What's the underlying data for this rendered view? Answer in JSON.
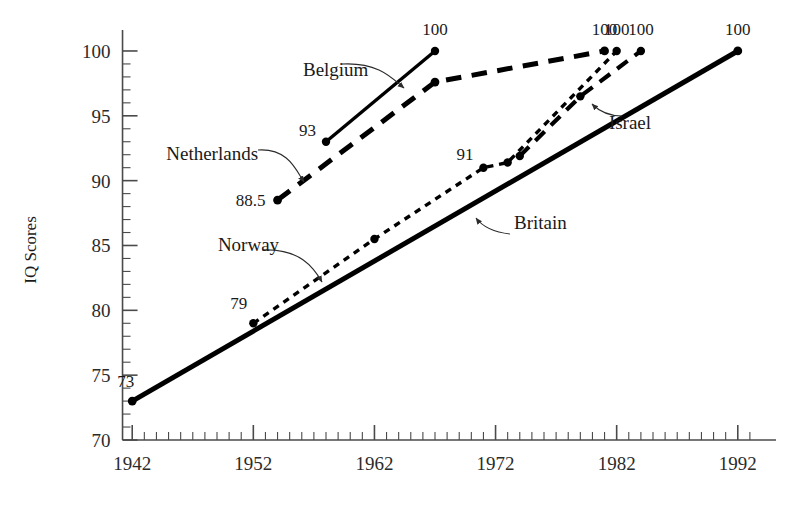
{
  "chart_data": {
    "type": "line",
    "title": "",
    "subtitle": "",
    "xlabel": "",
    "ylabel": "IQ Scores",
    "xlim": [
      1940,
      1994
    ],
    "ylim": [
      70,
      101
    ],
    "grid": false,
    "legend_position": "inline-annotations",
    "x_major_ticks": [
      1942,
      1952,
      1962,
      1972,
      1982,
      1992
    ],
    "x_tick_labels": [
      "1942",
      "1952",
      "1962",
      "1972",
      "1982",
      "1992"
    ],
    "x_minor_tick_step": 1,
    "y_major_ticks": [
      70,
      75,
      80,
      85,
      90,
      95,
      100
    ],
    "y_tick_labels": [
      "70",
      "75",
      "80",
      "85",
      "90",
      "95",
      "100"
    ],
    "y_minor_tick_step": 1,
    "series": [
      {
        "name": "Britain",
        "line_style": "solid",
        "line_width": 5.0,
        "x": [
          1942,
          1992
        ],
        "y": [
          73,
          100
        ],
        "point_labels": [
          "73",
          "100"
        ]
      },
      {
        "name": "Norway",
        "line_style": "short-dash",
        "line_width": 3.4,
        "x": [
          1952,
          1962,
          1971,
          1973,
          1982
        ],
        "y": [
          79,
          85.5,
          91,
          91.4,
          100
        ],
        "point_labels": [
          "79",
          "",
          "91",
          "",
          "100"
        ]
      },
      {
        "name": "Netherlands",
        "line_style": "long-dash",
        "line_width": 5.0,
        "x": [
          1954,
          1967,
          1981
        ],
        "y": [
          88.5,
          97.6,
          100
        ],
        "point_labels": [
          "88.5",
          "",
          "100"
        ]
      },
      {
        "name": "Belgium",
        "line_style": "solid",
        "line_width": 3.4,
        "x": [
          1958,
          1967
        ],
        "y": [
          93,
          100
        ],
        "point_labels": [
          "93",
          "100"
        ]
      },
      {
        "name": "Israel",
        "line_style": "long-dash",
        "line_width": 4.2,
        "x": [
          1974,
          1979,
          1984
        ],
        "y": [
          91.9,
          96.5,
          100
        ],
        "point_labels": [
          "",
          "",
          "100"
        ]
      }
    ],
    "annotations": [
      {
        "text": "Belgium",
        "x": 1958.8,
        "y": 98.1
      },
      {
        "text": "Netherlands",
        "x": 1948.6,
        "y": 91.6
      },
      {
        "text": "Norway",
        "x": 1951.6,
        "y": 84.6
      },
      {
        "text": "Israel",
        "x": 1983.1,
        "y": 94.0
      },
      {
        "text": "Britain",
        "x": 1975.7,
        "y": 86.3
      }
    ],
    "value_labels": [
      "100",
      "93",
      "100",
      "88.5",
      "91",
      "100",
      "100",
      "100",
      "100",
      "79",
      "73"
    ]
  },
  "axes": {
    "y_title": "IQ Scores"
  }
}
